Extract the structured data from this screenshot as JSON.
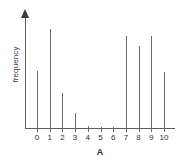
{
  "chart_data": {
    "type": "bar",
    "title": "",
    "subtitle": "",
    "xlabel": "A",
    "ylabel": "frequency",
    "categories": [
      "0",
      "1",
      "2",
      "3",
      "4",
      "5",
      "6",
      "7",
      "8",
      "9",
      "10"
    ],
    "values": [
      57,
      99,
      35,
      15,
      2,
      1,
      1,
      92,
      82,
      92,
      56
    ],
    "ylim": [
      0,
      118
    ],
    "xlim": [
      0,
      10
    ],
    "grid": false,
    "legend": null,
    "annotations": []
  },
  "axes": {
    "y_title": "frequency",
    "x_title": "A",
    "y_arrow": "up-arrow-icon",
    "y_tick_labels": [],
    "x_tick_labels": [
      "0",
      "1",
      "2",
      "3",
      "4",
      "5",
      "6",
      "7",
      "8",
      "9",
      "10"
    ]
  },
  "style": {
    "background": "#ffffff",
    "bar_color": "#6b6b6b",
    "axis_color": "#5c5c5c",
    "text_color": "#2e2e2e"
  }
}
